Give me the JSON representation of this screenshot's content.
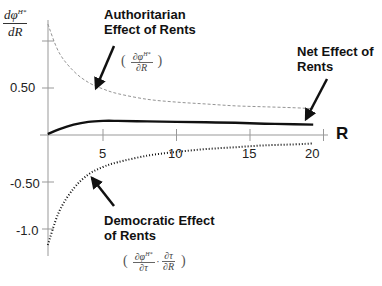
{
  "chart_data": {
    "type": "line",
    "title": "",
    "xlabel": "R",
    "ylabel": "dφ^{H*}/dR",
    "xlim": [
      1.25,
      21
    ],
    "ylim": [
      -1.25,
      1.2
    ],
    "x_ticks": [
      5,
      10,
      15,
      20
    ],
    "x_tick_labels": [
      "5",
      "10",
      "15",
      "20"
    ],
    "y_ticks": [
      1.0,
      0.5,
      -0.5,
      -1.0
    ],
    "y_tick_labels": [
      "",
      "0.50",
      "-0.50",
      "-1.0"
    ],
    "grid": false,
    "legend": null,
    "x": [
      1.25,
      2,
      3,
      4,
      5,
      6,
      8,
      10,
      12,
      14,
      16,
      18,
      19.3
    ],
    "series": [
      {
        "name": "Authoritarian Effect of Rents",
        "style": "dashed-thin",
        "values": [
          1.18,
          0.88,
          0.68,
          0.56,
          0.49,
          0.44,
          0.38,
          0.35,
          0.33,
          0.31,
          0.3,
          0.29,
          0.28
        ]
      },
      {
        "name": "Net Effect of Rents",
        "style": "solid-thick",
        "values": [
          0.01,
          0.06,
          0.11,
          0.14,
          0.15,
          0.15,
          0.145,
          0.14,
          0.135,
          0.13,
          0.12,
          0.115,
          0.11
        ]
      },
      {
        "name": "Democratic Effect of Rents",
        "style": "dotted",
        "values": [
          -1.17,
          -0.82,
          -0.57,
          -0.42,
          -0.34,
          -0.29,
          -0.22,
          -0.18,
          -0.15,
          -0.13,
          -0.11,
          -0.1,
          -0.09
        ]
      }
    ],
    "annotations": [
      {
        "text": "Authoritarian Effect of Rents",
        "formula": "(∂φ^{H*}/∂R)"
      },
      {
        "text": "Net Effect of Rents"
      },
      {
        "text": "Democratic Effect of Rents",
        "formula": "(∂φ^{H*}/∂τ · ∂τ/∂R)"
      }
    ]
  },
  "labels": {
    "ylabel_num": "dφ",
    "ylabel_sup": "H*",
    "ylabel_den": "dR",
    "x_axis_title": "R",
    "authoritarian_line1": "Authoritarian",
    "authoritarian_line2": "Effect of Rents",
    "net_line1": "Net Effect of",
    "net_line2": "Rents",
    "democratic_line1": "Democratic Effect",
    "democratic_line2": "of Rents",
    "auth_formula_num": "∂φ",
    "auth_formula_sup": "H*",
    "auth_formula_den": "∂R",
    "dem_formula_num1": "∂φ",
    "dem_formula_sup1": "H*",
    "dem_formula_den1": "∂τ",
    "dem_formula_dot": "·",
    "dem_formula_num2": "∂τ",
    "dem_formula_den2": "∂R",
    "paren_open": "(",
    "paren_close": ")"
  },
  "ticks": {
    "y_050": "0.50",
    "y_m050": "-0.50",
    "y_m10": "-1.0",
    "x_5": "5",
    "x_10": "10",
    "x_15": "15",
    "x_20": "20"
  }
}
